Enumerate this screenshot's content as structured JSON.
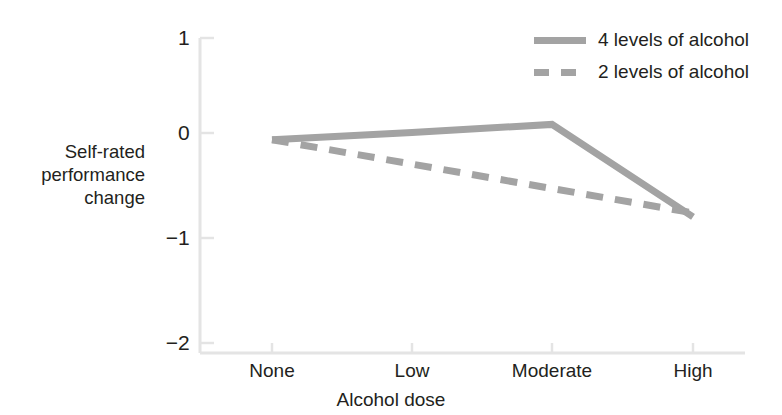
{
  "chart_data": {
    "type": "line",
    "title": "",
    "xlabel": "Alcohol dose",
    "ylabel": "Self-rated performance change",
    "ylabel_lines": [
      "Self-rated",
      "performance",
      "change"
    ],
    "categories": [
      "None",
      "Low",
      "Moderate",
      "High"
    ],
    "yticks": [
      "1",
      "0",
      "−1",
      "−2"
    ],
    "ytick_values": [
      1,
      0,
      -1,
      -2
    ],
    "ylim": [
      -2,
      1
    ],
    "grid": false,
    "legend_position": "top-right",
    "series": [
      {
        "name": "4 levels of alcohol",
        "style": "solid",
        "color": "#a3a3a3",
        "values": [
          0.0,
          0.07,
          0.15,
          -0.76
        ]
      },
      {
        "name": "2 levels of alcohol",
        "style": "dashed",
        "color": "#a3a3a3",
        "values": [
          0.0,
          -0.24,
          -0.48,
          -0.72
        ]
      }
    ]
  },
  "axis": {
    "line_color": "#e2e2e2",
    "tick_color": "#e2e2e2"
  },
  "legend": {
    "entries": [
      {
        "label": "4 levels of alcohol",
        "style": "solid"
      },
      {
        "label": "2 levels of alcohol",
        "style": "dashed"
      }
    ]
  }
}
